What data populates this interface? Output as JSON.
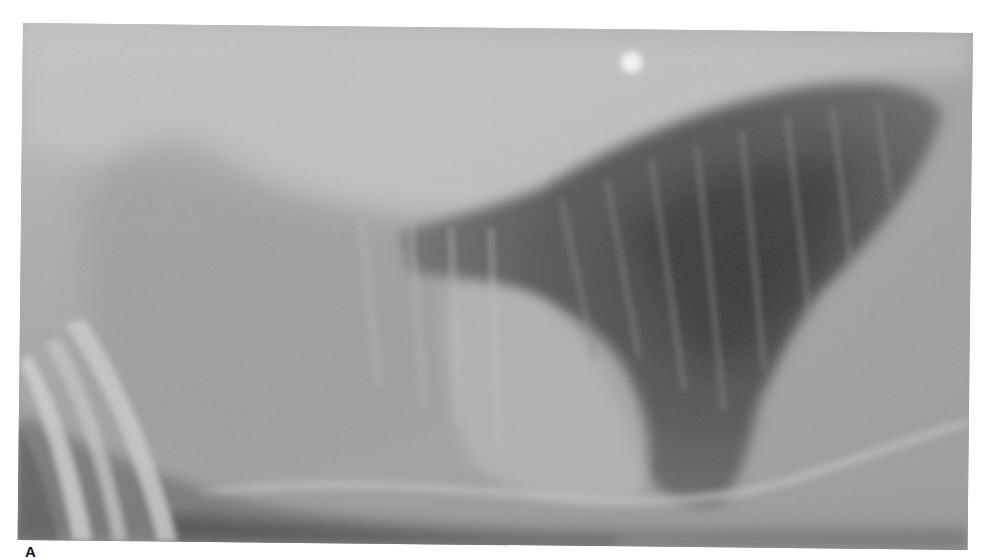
{
  "figure": {
    "panel_label": "A",
    "image": {
      "kind": "radiograph",
      "view": "lateral thoracic radiograph",
      "tone": "grayscale",
      "features": [
        "radiolucent-lung-field-icon",
        "spine-band-icon",
        "round-radiopaque-marker-icon",
        "limb-bones-icon",
        "rib-lines-icon"
      ]
    },
    "colors": {
      "background": "#ffffff",
      "film_base": "#a9a9a9",
      "lung_dark": "#4a4a4a",
      "spine_light": "#c8c8c8",
      "marker_white": "#f4f4f4",
      "label": "#111111"
    }
  }
}
